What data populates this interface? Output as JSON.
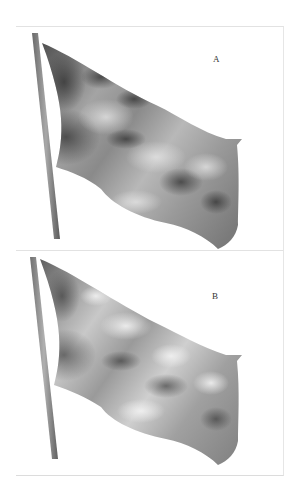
{
  "figure": {
    "panels": [
      {
        "label": "A",
        "shading": "darker, high-contrast blotchy shading"
      },
      {
        "label": "B",
        "shading": "smoother, lighter highlights"
      }
    ]
  },
  "colors": {
    "background": "#ffffff",
    "frame": "#e2e2e2",
    "pole": "#8a8a8a",
    "flag_light": "#d6d6d6",
    "flag_mid": "#9a9a9a",
    "flag_dark": "#3a3a3a"
  }
}
